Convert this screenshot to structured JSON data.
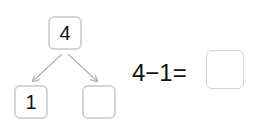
{
  "diagram": {
    "type": "number-bond",
    "whole": "4",
    "parts": [
      "1",
      ""
    ],
    "line_color": "#b0b0b0",
    "box_border_color": "#d4d4d4"
  },
  "equation": {
    "text": "4−1=",
    "answer": ""
  }
}
